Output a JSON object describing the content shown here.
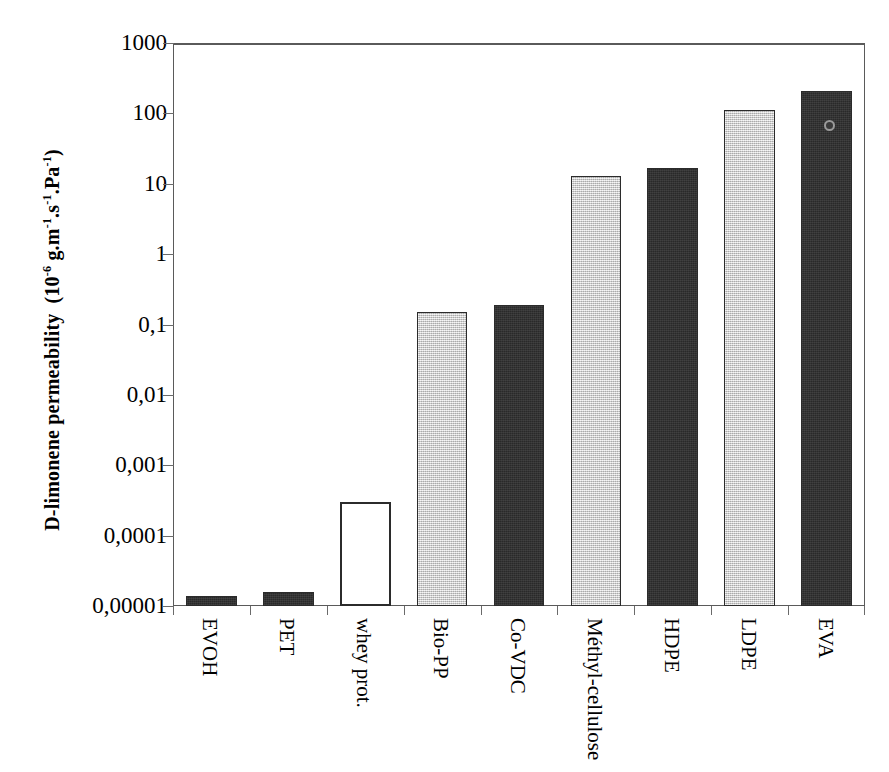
{
  "chart_data": {
    "type": "bar",
    "title": "",
    "subtitle": "",
    "xlabel": "",
    "ylabel": "D-limonene permeability  (10-6 g.m-1.s-1.Pa-1)",
    "ylabel_parts": {
      "main": "D-limonene permeability",
      "unit_open": "(10",
      "unit_exp1": "-6",
      "unit_g_m": " g.m",
      "unit_exp2": "-1",
      "unit_s": ".s",
      "unit_exp3": "-1",
      "unit_pa": ".Pa",
      "unit_exp4": "-1",
      "unit_close": ")"
    },
    "categories": [
      "EVOH",
      "PET",
      "whey prot.",
      "Bio-PP",
      "Co-VDC",
      "Méthyl-cellulose",
      "HDPE",
      "LDPE",
      "EVA"
    ],
    "values": [
      1.4e-05,
      1.6e-05,
      0.0003,
      0.15,
      0.19,
      13,
      17,
      112,
      210
    ],
    "bar_styles": [
      "dark",
      "dark",
      "white",
      "light",
      "dark",
      "light",
      "dark",
      "light",
      "dark"
    ],
    "scale": "log",
    "ylim": [
      1e-05,
      1000
    ],
    "yticks": [
      1000,
      100,
      10,
      1,
      0.1,
      0.01,
      0.001,
      0.0001,
      1e-05
    ],
    "ytick_labels": [
      "1000",
      "100",
      "10",
      "1",
      "0,1",
      "0,01",
      "0,001",
      "0,0001",
      "0,00001"
    ],
    "grid": false,
    "legend": "none",
    "colors": {
      "dark_fill": "#2e2e2e",
      "light_fill": "#d9d9d9",
      "white_fill": "#ffffff",
      "bar_outline": "#2b2b2b",
      "axis": "#5a5a5a",
      "text": "#000000",
      "background": "#ffffff"
    },
    "annotations": []
  }
}
